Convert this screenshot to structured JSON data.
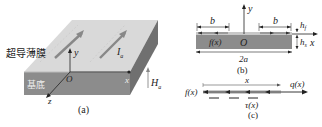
{
  "panel_a": {
    "film_label": "超导薄膜",
    "substrate_label": "基底",
    "axis_y": "y",
    "axis_x": "x",
    "axis_z": "z",
    "origin": "O",
    "current_label": "I",
    "current_sub": "a",
    "field_label": "H",
    "field_sub": "a",
    "caption": "(a)"
  },
  "panel_b": {
    "axis_y": "y",
    "axis_x": "x",
    "origin": "O",
    "b_left": "b",
    "b_right": "b",
    "hf": "h",
    "hf_sub": "f",
    "hs": "h",
    "hs_sub": "s",
    "fx": "f(x)",
    "width": "2a",
    "caption": "(b)"
  },
  "panel_c": {
    "fx": "f(x)",
    "x_label": "x",
    "qx": "q(x)",
    "tau": "τ(x)",
    "caption": "(c)"
  },
  "colors": {
    "film_top": "#d8d8d8",
    "substrate_front": "#8a8a8a",
    "substrate_side": "#6e6e6e",
    "film_strip": "#c8c8c8",
    "ink": "#222222"
  }
}
